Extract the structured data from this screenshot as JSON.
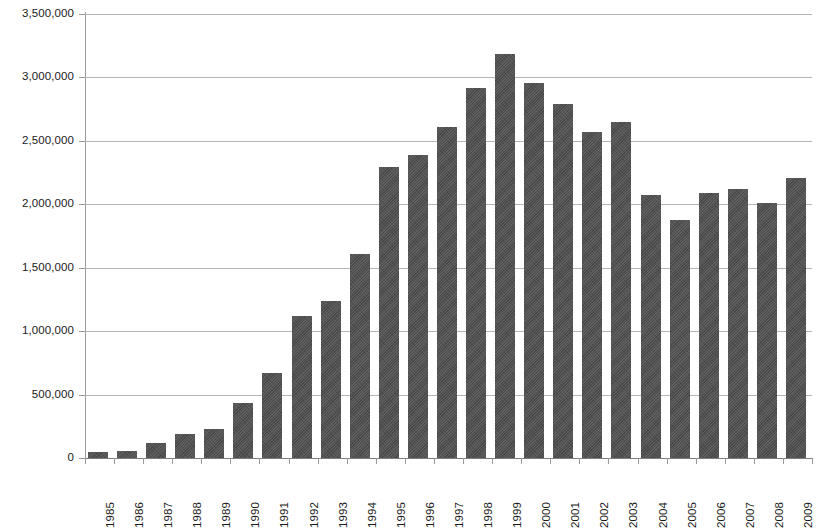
{
  "chart_data": {
    "type": "bar",
    "title": "",
    "subtitle": "",
    "xlabel": "",
    "ylabel": "",
    "ylim": [
      0,
      3500000
    ],
    "ytick_step": 500000,
    "grid": true,
    "legend": false,
    "legend_position": "none",
    "orientation": "vertical",
    "bar_color": "#4e4e4e",
    "grid_color": "#b4b4b4",
    "axis_color": "#9a9a9a",
    "text_color": "#1a1a1a",
    "background_color": "#ffffff",
    "y_tick_labels": [
      "3,500,000",
      "3,000,000",
      "2,500,000",
      "2,000,000",
      "1,500,000",
      "1,000,000",
      "500,000",
      "0"
    ],
    "y_tick_values": [
      3500000,
      3000000,
      2500000,
      2000000,
      1500000,
      1000000,
      500000,
      0
    ],
    "categories": [
      "1985",
      "1986",
      "1987",
      "1988",
      "1989",
      "1990",
      "1991",
      "1992",
      "1993",
      "1994",
      "1995",
      "1996",
      "1997",
      "1998",
      "1999",
      "2000",
      "2001",
      "2002",
      "2003",
      "2004",
      "2005",
      "2006",
      "2007",
      "2008",
      "2009"
    ],
    "values": [
      50000,
      55000,
      120000,
      190000,
      230000,
      430000,
      670000,
      1120000,
      1235000,
      1605000,
      2295000,
      2385000,
      2610000,
      2920000,
      3185000,
      2955000,
      2790000,
      2570000,
      2650000,
      2070000,
      1880000,
      2090000,
      2120000,
      2010000,
      2210000
    ]
  }
}
